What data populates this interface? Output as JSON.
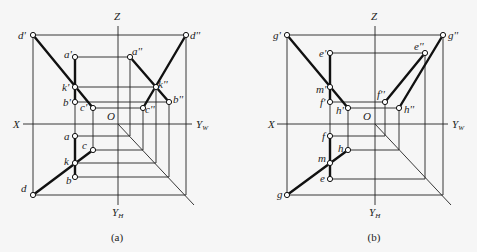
{
  "figure": {
    "background": "#f6f6f6",
    "line_color": "#111111"
  },
  "panels": [
    {
      "id": "a",
      "caption": "(a)",
      "caption_pos": [
        117,
        241
      ],
      "origin": [
        118,
        124
      ],
      "axes": {
        "x_label": "X",
        "x_label_pos": [
          13,
          128
        ],
        "x_start": 23,
        "x_end": 192,
        "yw_label": "Y",
        "yw_sub": "W",
        "yw_label_pos": [
          196,
          128
        ],
        "z_label": "Z",
        "z_label_pos": [
          114,
          20
        ],
        "z_start": 26,
        "z_end": 205,
        "yh_label": "Y",
        "yh_sub": "H",
        "yh_label_pos": [
          112,
          216
        ],
        "o_label": "O",
        "o_label_pos": [
          107,
          120
        ],
        "diag_end": [
          194,
          205
        ]
      },
      "points": [
        {
          "name": "d'",
          "x": 33,
          "y": 35,
          "lx": 18,
          "ly": 39
        },
        {
          "name": "a'",
          "x": 75,
          "y": 57,
          "lx": 64,
          "ly": 58
        },
        {
          "name": "k'",
          "x": 75,
          "y": 87,
          "lx": 62,
          "ly": 91
        },
        {
          "name": "b'",
          "x": 75,
          "y": 102,
          "lx": 63,
          "ly": 106
        },
        {
          "name": "c'",
          "x": 93,
          "y": 108,
          "lx": 80,
          "ly": 111
        },
        {
          "name": "d''",
          "x": 186,
          "y": 35,
          "lx": 190,
          "ly": 39
        },
        {
          "name": "a''",
          "x": 130,
          "y": 57,
          "lx": 132,
          "ly": 55
        },
        {
          "name": "k''",
          "x": 156,
          "y": 87,
          "lx": 158,
          "ly": 88
        },
        {
          "name": "b''",
          "x": 169,
          "y": 102,
          "lx": 173,
          "ly": 103
        },
        {
          "name": "c''",
          "x": 143,
          "y": 108,
          "lx": 145,
          "ly": 113
        },
        {
          "name": "a",
          "x": 75,
          "y": 136,
          "lx": 64,
          "ly": 140
        },
        {
          "name": "c",
          "x": 93,
          "y": 150,
          "lx": 82,
          "ly": 149
        },
        {
          "name": "k",
          "x": 75,
          "y": 163,
          "lx": 64,
          "ly": 165
        },
        {
          "name": "b",
          "x": 75,
          "y": 177,
          "lx": 66,
          "ly": 184
        },
        {
          "name": "d",
          "x": 33,
          "y": 195,
          "lx": 21,
          "ly": 192
        }
      ],
      "thin_lines": [
        [
          33,
          35,
          186,
          35
        ],
        [
          75,
          57,
          130,
          57
        ],
        [
          75,
          87,
          156,
          87
        ],
        [
          75,
          102,
          169,
          102
        ],
        [
          93,
          108,
          143,
          108
        ],
        [
          33,
          35,
          33,
          195
        ],
        [
          186,
          35,
          186,
          195
        ],
        [
          130,
          57,
          130,
          136
        ],
        [
          156,
          87,
          156,
          163
        ],
        [
          169,
          102,
          169,
          177
        ],
        [
          143,
          108,
          143,
          150
        ],
        [
          75,
          136,
          130,
          136
        ],
        [
          93,
          150,
          143,
          150
        ],
        [
          75,
          163,
          156,
          163
        ],
        [
          75,
          177,
          169,
          177
        ],
        [
          33,
          195,
          186,
          195
        ],
        [
          75,
          102,
          75,
          136
        ],
        [
          93,
          108,
          93,
          150
        ]
      ],
      "thick_lines": [
        [
          33,
          35,
          93,
          108
        ],
        [
          75,
          57,
          75,
          102
        ],
        [
          186,
          35,
          143,
          108
        ],
        [
          130,
          57,
          169,
          102
        ],
        [
          75,
          136,
          75,
          177
        ],
        [
          33,
          195,
          93,
          150
        ]
      ]
    },
    {
      "id": "b",
      "caption": "(b)",
      "caption_pos": [
        374,
        241
      ],
      "origin": [
        375,
        124
      ],
      "axes": {
        "x_label": "X",
        "x_label_pos": [
          268,
          128
        ],
        "x_start": 277,
        "x_end": 448,
        "yw_label": "Y",
        "yw_sub": "W",
        "yw_label_pos": [
          452,
          128
        ],
        "z_label": "Z",
        "z_label_pos": [
          371,
          20
        ],
        "z_start": 26,
        "z_end": 205,
        "yh_label": "Y",
        "yh_sub": "H",
        "yh_label_pos": [
          369,
          216
        ],
        "o_label": "O",
        "o_label_pos": [
          363,
          120
        ],
        "diag_end": [
          451,
          205
        ]
      },
      "points": [
        {
          "name": "g'",
          "x": 287,
          "y": 35,
          "lx": 273,
          "ly": 39
        },
        {
          "name": "e'",
          "x": 330,
          "y": 53,
          "lx": 319,
          "ly": 57
        },
        {
          "name": "m'",
          "x": 330,
          "y": 87,
          "lx": 316,
          "ly": 93
        },
        {
          "name": "f'",
          "x": 330,
          "y": 102,
          "lx": 320,
          "ly": 106
        },
        {
          "name": "h'",
          "x": 348,
          "y": 108,
          "lx": 336,
          "ly": 114
        },
        {
          "name": "g''",
          "x": 443,
          "y": 35,
          "lx": 448,
          "ly": 39
        },
        {
          "name": "e''",
          "x": 425,
          "y": 53,
          "lx": 414,
          "ly": 50
        },
        {
          "name": "f''",
          "x": 385,
          "y": 102,
          "lx": 377,
          "ly": 98
        },
        {
          "name": "h''",
          "x": 399,
          "y": 108,
          "lx": 404,
          "ly": 113
        },
        {
          "name": "f",
          "x": 330,
          "y": 136,
          "lx": 322,
          "ly": 140
        },
        {
          "name": "h",
          "x": 348,
          "y": 150,
          "lx": 338,
          "ly": 152
        },
        {
          "name": "m",
          "x": 330,
          "y": 163,
          "lx": 318,
          "ly": 162
        },
        {
          "name": "e",
          "x": 330,
          "y": 179,
          "lx": 320,
          "ly": 182
        },
        {
          "name": "g",
          "x": 287,
          "y": 195,
          "lx": 277,
          "ly": 198
        }
      ],
      "thin_lines": [
        [
          287,
          35,
          443,
          35
        ],
        [
          330,
          53,
          425,
          53
        ],
        [
          330,
          102,
          385,
          102
        ],
        [
          348,
          108,
          399,
          108
        ],
        [
          287,
          35,
          287,
          195
        ],
        [
          443,
          35,
          443,
          195
        ],
        [
          425,
          53,
          425,
          179
        ],
        [
          385,
          102,
          385,
          136
        ],
        [
          399,
          108,
          399,
          150
        ],
        [
          330,
          136,
          385,
          136
        ],
        [
          348,
          150,
          399,
          150
        ],
        [
          330,
          179,
          425,
          179
        ],
        [
          287,
          195,
          443,
          195
        ],
        [
          330,
          102,
          330,
          136
        ],
        [
          348,
          108,
          348,
          150
        ]
      ],
      "thick_lines": [
        [
          287,
          35,
          348,
          108
        ],
        [
          330,
          53,
          330,
          102
        ],
        [
          443,
          35,
          399,
          108
        ],
        [
          425,
          53,
          385,
          102
        ],
        [
          330,
          136,
          330,
          179
        ],
        [
          287,
          195,
          348,
          150
        ]
      ]
    }
  ]
}
